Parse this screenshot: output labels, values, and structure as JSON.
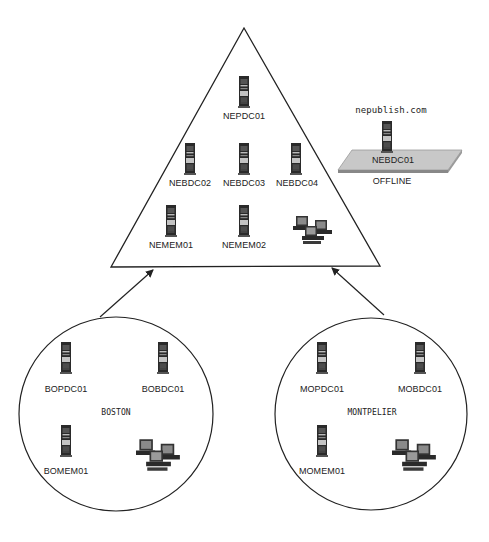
{
  "diagram": {
    "type": "network-domain-topology",
    "colors": {
      "line": "#222222",
      "server_body": "#2a2a2a",
      "server_panel": "#bcbcbc",
      "platform": "#c8c8c8",
      "background": "#ffffff"
    },
    "domain_triangle": {
      "servers": [
        {
          "label": "NEPDC01"
        },
        {
          "label": "NEBDC02"
        },
        {
          "label": "NEBDC03"
        },
        {
          "label": "NEBDC04"
        },
        {
          "label": "NEMEM01"
        },
        {
          "label": "NEMEM02"
        }
      ],
      "workstations_icon": "workstation-group-icon"
    },
    "offline_server": {
      "domain": "nepublish.com",
      "label": "NEBDC01",
      "status": "OFFLINE"
    },
    "sites": [
      {
        "name": "BOSTON",
        "servers": [
          {
            "label": "BOPDC01"
          },
          {
            "label": "BOBDC01"
          },
          {
            "label": "BOMEM01"
          }
        ],
        "workstations_icon": "workstation-group-icon"
      },
      {
        "name": "MONTPELIER",
        "servers": [
          {
            "label": "MOPDC01"
          },
          {
            "label": "MOBDC01"
          },
          {
            "label": "MOMEM01"
          }
        ],
        "workstations_icon": "workstation-group-icon"
      }
    ],
    "connections": [
      {
        "from": "BOSTON",
        "to": "domain_triangle"
      },
      {
        "from": "MONTPELIER",
        "to": "domain_triangle"
      }
    ]
  }
}
